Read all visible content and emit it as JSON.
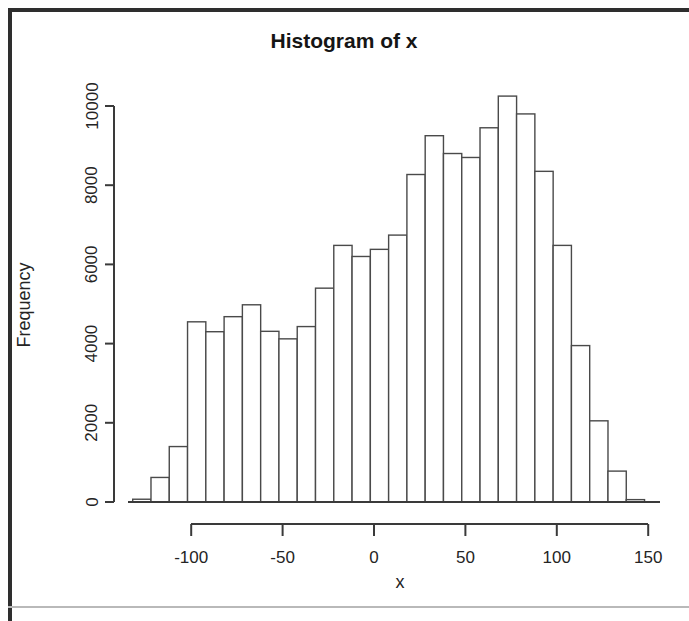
{
  "figure": {
    "title": "Histogram of x",
    "xlabel": "x",
    "ylabel": "Frequency"
  },
  "axes": {
    "y_ticks": [
      "0",
      "2000",
      "4000",
      "6000",
      "8000",
      "10000"
    ],
    "x_ticks": [
      "-100",
      "-50",
      "0",
      "50",
      "100",
      "150"
    ]
  },
  "colors": {
    "background": "#ffffff",
    "bar_fill": "#ffffff",
    "bar_stroke": "#4a4a4a",
    "axis": "#3a3a3a",
    "text": "#242424",
    "page_border": "#2e2e2e"
  },
  "chart_data": {
    "type": "bar",
    "title": "Histogram of x",
    "xlabel": "x",
    "ylabel": "Frequency",
    "xlim": [
      -132,
      148
    ],
    "ylim": [
      0,
      10400
    ],
    "grid": false,
    "legend": "none",
    "bin_width": 10,
    "bin_edges": [
      -132,
      -122,
      -112,
      -102,
      -92,
      -82,
      -72,
      -62,
      -52,
      -42,
      -32,
      -22,
      -12,
      -2,
      8,
      18,
      28,
      38,
      48,
      58,
      68,
      78,
      88,
      98,
      108,
      118,
      128,
      138,
      148
    ],
    "bin_centers": [
      -127,
      -117,
      -107,
      -97,
      -87,
      -77,
      -67,
      -57,
      -47,
      -37,
      -27,
      -17,
      -7,
      3,
      13,
      23,
      33,
      43,
      53,
      63,
      73,
      83,
      93,
      103,
      113,
      123,
      133,
      143
    ],
    "categories": [
      "-132 to -122",
      "-122 to -112",
      "-112 to -102",
      "-102 to -92",
      "-92 to -82",
      "-82 to -72",
      "-72 to -62",
      "-62 to -52",
      "-52 to -42",
      "-42 to -32",
      "-32 to -22",
      "-22 to -12",
      "-12 to -2",
      "-2 to 8",
      "8 to 18",
      "18 to 28",
      "28 to 38",
      "38 to 48",
      "48 to 58",
      "58 to 68",
      "68 to 78",
      "78 to 88",
      "88 to 98",
      "98 to 108",
      "108 to 118",
      "118 to 128",
      "128 to 138",
      "138 to 148"
    ],
    "values": [
      70,
      620,
      1400,
      4550,
      4300,
      4680,
      4980,
      4310,
      4120,
      4430,
      5400,
      6480,
      6200,
      6380,
      6740,
      8270,
      9250,
      8800,
      8700,
      9450,
      10250,
      9800,
      8350,
      6480,
      3950,
      2050,
      780,
      60
    ]
  }
}
